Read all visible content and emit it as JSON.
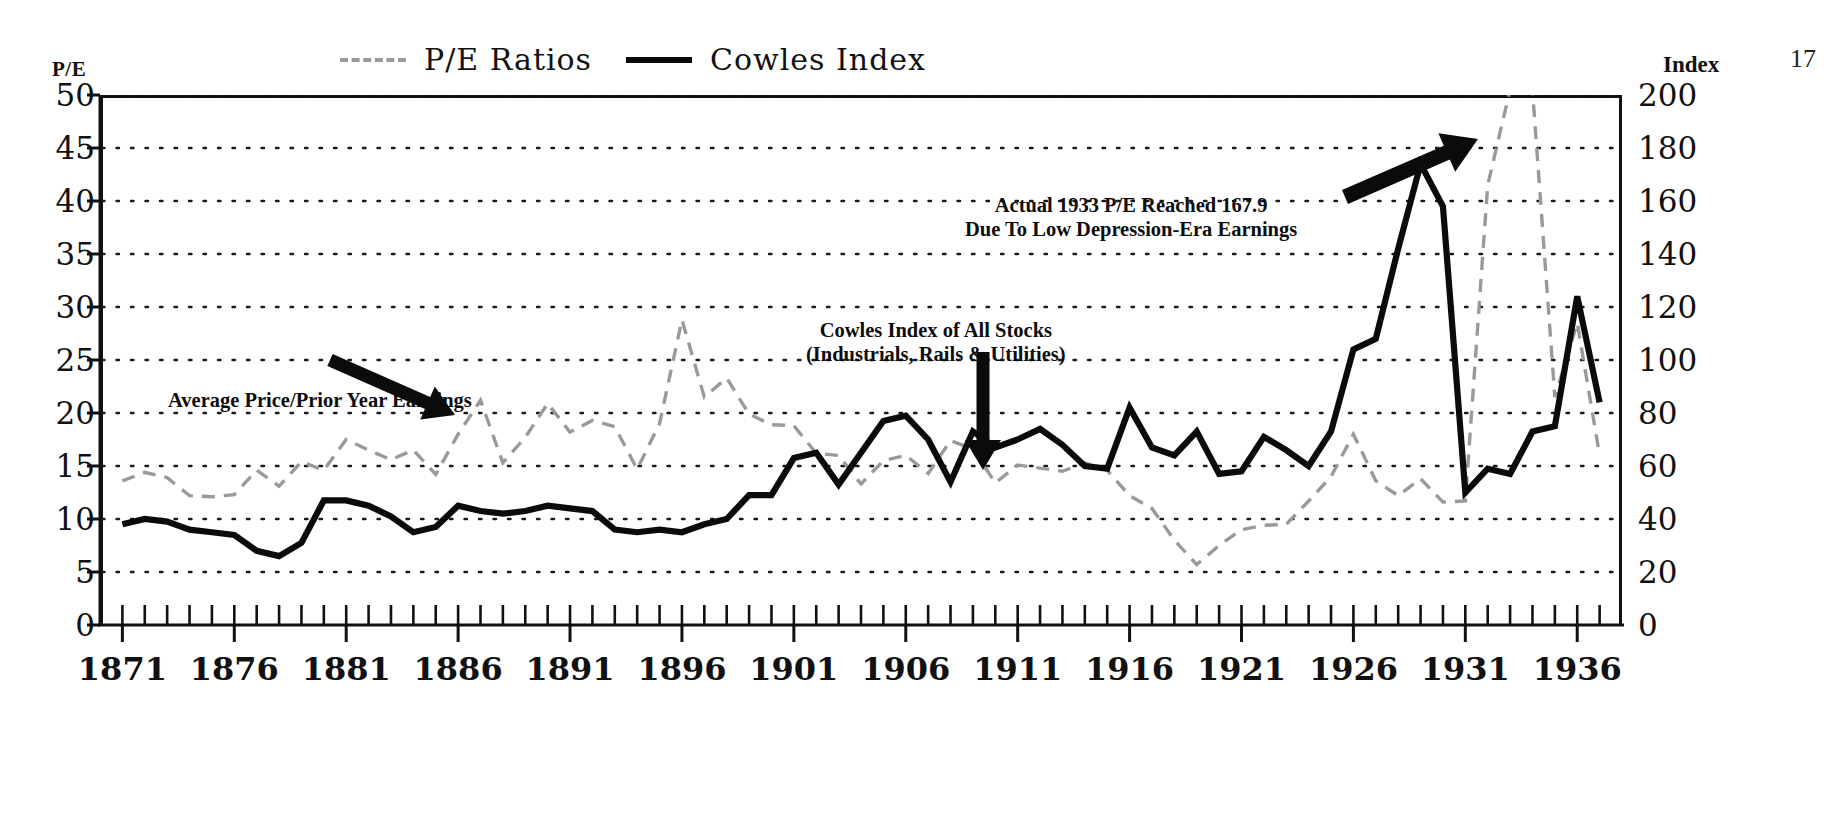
{
  "page_number": "17",
  "axis_titles": {
    "left": "P/E",
    "right": "Index"
  },
  "legend": {
    "entries": [
      {
        "label": "P/E Ratios",
        "style": "dashed",
        "color": "#9a9a9a",
        "icon": "dashed-line-swatch-icon"
      },
      {
        "label": "Cowles Index",
        "style": "solid",
        "color": "#0b0b0b",
        "icon": "solid-line-swatch-icon"
      }
    ]
  },
  "annotations": {
    "pe_series": {
      "line1": "Average Price/Prior Year Earnings"
    },
    "cowles_series": {
      "line1": "Cowles Index of All Stocks",
      "line2": "(Industrials, Rails & Utilities)"
    },
    "peak_1933": {
      "line1": "Actual 1933 P/E Reached 167.9",
      "line2": "Due To Low Depression-Era Earnings"
    }
  },
  "chart_data": {
    "type": "line",
    "title": "",
    "xlabel": "",
    "grid": true,
    "legend_position": "top",
    "x": [
      1871,
      1872,
      1873,
      1874,
      1875,
      1876,
      1877,
      1878,
      1879,
      1880,
      1881,
      1882,
      1883,
      1884,
      1885,
      1886,
      1887,
      1888,
      1889,
      1890,
      1891,
      1892,
      1893,
      1894,
      1895,
      1896,
      1897,
      1898,
      1899,
      1900,
      1901,
      1902,
      1903,
      1904,
      1905,
      1906,
      1907,
      1908,
      1909,
      1910,
      1911,
      1912,
      1913,
      1914,
      1915,
      1916,
      1917,
      1918,
      1919,
      1920,
      1921,
      1922,
      1923,
      1924,
      1925,
      1926,
      1927,
      1928,
      1929,
      1930,
      1931,
      1932,
      1933,
      1934,
      1935,
      1936,
      1937
    ],
    "xticks": [
      1871,
      1876,
      1881,
      1886,
      1891,
      1896,
      1901,
      1906,
      1911,
      1916,
      1921,
      1926,
      1931,
      1936
    ],
    "xtick_labels": [
      "1871",
      "1876",
      "1881",
      "1886",
      "1891",
      "1896",
      "1901",
      "1906",
      "1911",
      "1916",
      "1921",
      "1926",
      "1931",
      "1936"
    ],
    "xlim": [
      1870,
      1938
    ],
    "axes": [
      {
        "id": "left",
        "label": "P/E",
        "ylim": [
          0,
          50
        ],
        "yticks": [
          0,
          5,
          10,
          15,
          20,
          25,
          30,
          35,
          40,
          45,
          50
        ],
        "ytick_labels": [
          "0",
          "5",
          "10",
          "15",
          "20",
          "25",
          "30",
          "35",
          "40",
          "45",
          "50"
        ]
      },
      {
        "id": "right",
        "label": "Index",
        "ylim": [
          0,
          200
        ],
        "yticks": [
          0,
          20,
          40,
          60,
          80,
          100,
          120,
          140,
          160,
          180,
          200
        ],
        "ytick_labels": [
          "0",
          "20",
          "40",
          "60",
          "80",
          "100",
          "120",
          "140",
          "160",
          "180",
          "200"
        ]
      }
    ],
    "series": [
      {
        "name": "P/E Ratios",
        "axis": "left",
        "style": "dashed",
        "color": "#9a9a9a",
        "values": [
          13.6,
          14.4,
          13.9,
          12.2,
          12.1,
          12.3,
          14.6,
          13.1,
          15.4,
          14.6,
          17.5,
          16.5,
          15.6,
          16.5,
          14.2,
          18.0,
          21.2,
          15.3,
          17.7,
          20.9,
          18.2,
          19.3,
          18.7,
          14.7,
          19.0,
          28.8,
          21.5,
          23.3,
          19.9,
          18.9,
          18.8,
          16.2,
          16.0,
          13.3,
          15.5,
          16.0,
          14.3,
          17.4,
          16.6,
          13.4,
          15.1,
          14.8,
          14.5,
          15.3,
          14.6,
          12.2,
          11.0,
          8.0,
          5.7,
          7.5,
          9.0,
          9.4,
          9.5,
          11.7,
          14.0,
          18.0,
          13.6,
          12.2,
          13.8,
          11.6,
          11.7,
          41.5,
          50.5,
          50.5,
          21.5,
          28.5,
          16.0
        ]
      },
      {
        "name": "Cowles Index",
        "axis": "right",
        "style": "solid",
        "color": "#0b0b0b",
        "values": [
          38,
          40,
          39,
          36,
          35,
          34,
          28,
          26,
          31,
          47,
          47,
          45,
          41,
          35,
          37,
          45,
          43,
          42,
          43,
          45,
          44,
          43,
          36,
          35,
          36,
          35,
          38,
          40,
          49,
          49,
          63,
          65,
          53,
          65,
          77,
          79,
          70,
          54,
          73,
          67,
          70,
          74,
          68,
          60,
          59,
          82,
          67,
          64,
          73,
          57,
          58,
          71,
          66,
          60,
          73,
          104,
          108,
          142,
          174,
          158,
          50,
          59,
          57,
          73,
          75,
          124,
          84
        ]
      }
    ],
    "notes": [
      "Actual 1933 P/E Reached 167.9",
      "Due To Low Depression-Era Earnings",
      "Average Price/Prior Year Earnings",
      "Cowles Index of All Stocks",
      "(Industrials, Rails & Utilities)"
    ]
  }
}
